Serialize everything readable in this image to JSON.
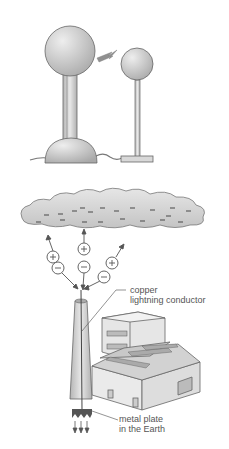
{
  "figure": {
    "top_panel": {
      "description": "Van de Graaff generator dome sparking to a smaller sphere",
      "elements": [
        "large-sphere",
        "insulating-column",
        "base-dome",
        "spark",
        "small-sphere",
        "small-rod",
        "base-plate",
        "wire"
      ]
    },
    "bottom_panel": {
      "description": "Charged cloud above a factory chimney with lightning conductor",
      "cloud_charge_symbol": "−",
      "charges": [
        {
          "sign": "+",
          "direction": "up"
        },
        {
          "sign": "−",
          "direction": "down"
        },
        {
          "sign": "+",
          "direction": "up"
        },
        {
          "sign": "−",
          "direction": "down"
        },
        {
          "sign": "+",
          "direction": "up"
        },
        {
          "sign": "−",
          "direction": "down"
        }
      ],
      "labels": {
        "conductor_line1": "copper",
        "conductor_line2": "lightning conductor",
        "plate_line1": "metal plate",
        "plate_line2": "in the Earth"
      }
    }
  },
  "colors": {
    "sphere": "#c8c8c8",
    "outline": "#555555",
    "cloud": "#d5d5d5",
    "building": "#e4e4e4"
  }
}
